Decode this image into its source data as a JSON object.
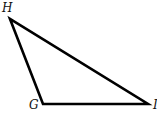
{
  "diagram": {
    "type": "triangle",
    "vertices": [
      {
        "label": "H",
        "x": 10,
        "y": 19
      },
      {
        "label": "G",
        "x": 43,
        "y": 104
      },
      {
        "label": "I",
        "x": 148,
        "y": 104
      }
    ],
    "stroke_color": "#000000",
    "background": "#ffffff"
  }
}
